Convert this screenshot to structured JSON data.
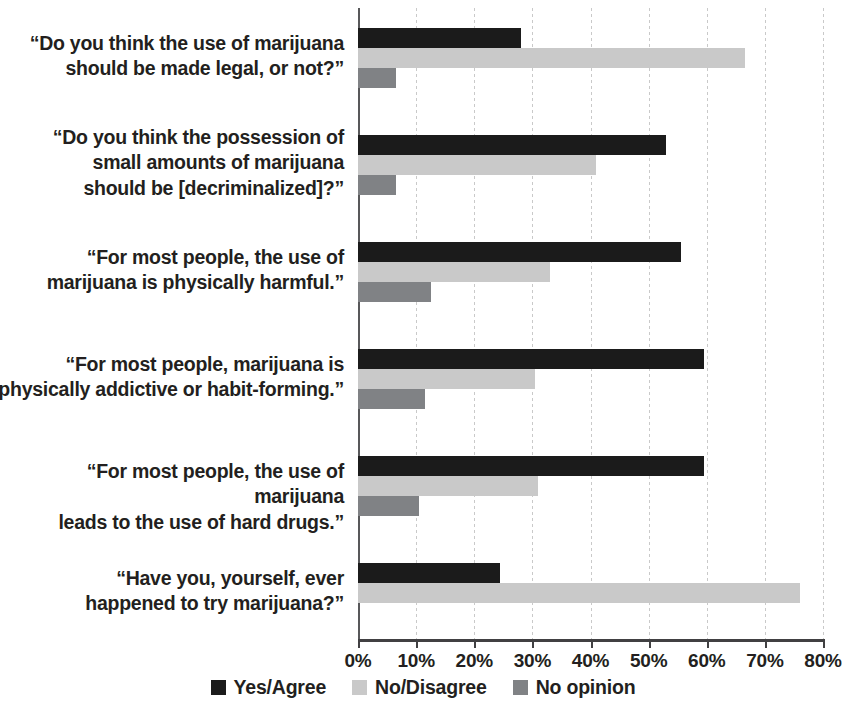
{
  "chart_data": {
    "type": "bar",
    "orientation": "horizontal",
    "title": "",
    "subtitle": "",
    "xlabel": "",
    "ylabel": "",
    "xlim": [
      0,
      80
    ],
    "xtick_labels": [
      "0%",
      "10%",
      "20%",
      "30%",
      "40%",
      "50%",
      "60%",
      "70%",
      "80%"
    ],
    "xtick_values": [
      0,
      10,
      20,
      30,
      40,
      50,
      60,
      70,
      80
    ],
    "grid": "vertical-dashed",
    "legend_position": "bottom-center",
    "categories": [
      "“Do you think the use of marijuana should be made legal, or not?”",
      "“Do you think the possession of small amounts of marijuana should be [decriminalized]?”",
      "“For most people, the use of marijuana is physically harmful.”",
      "“For most people, marijuana is physically addictive or habit-forming.”",
      "“For most people, the use of marijuana leads to the use of hard drugs.”",
      "“Have you, yourself, ever happened to try marijuana?”"
    ],
    "category_lines": [
      [
        "“Do you think the use of marijuana",
        "should be made legal, or not?”"
      ],
      [
        "“Do you think the possession of",
        "small amounts of marijuana",
        "should be [decriminalized]?”"
      ],
      [
        "“For most people, the use of",
        "marijuana is physically harmful.”"
      ],
      [
        "“For most people, marijuana is",
        "physically addictive or habit-forming.”"
      ],
      [
        "“For most people, the use of marijuana",
        "leads to the use of hard drugs.”"
      ],
      [
        "“Have you, yourself, ever",
        "happened to try marijuana?”"
      ]
    ],
    "series": [
      {
        "name": "Yes/Agree",
        "color": "#1b1b1b",
        "values": [
          28,
          53,
          55.5,
          59.5,
          59.5,
          24.5
        ]
      },
      {
        "name": "No/Disagree",
        "color": "#c9c9c9",
        "values": [
          66.5,
          41,
          33,
          30.5,
          31,
          76
        ]
      },
      {
        "name": "No opinion",
        "color": "#808285",
        "values": [
          6.5,
          6.5,
          12.5,
          11.5,
          10.5,
          null
        ]
      }
    ]
  },
  "legend": {
    "items": [
      {
        "label": "Yes/Agree"
      },
      {
        "label": "No/Disagree"
      },
      {
        "label": "No opinion"
      }
    ]
  },
  "axis": {
    "ticks": [
      "0%",
      "10%",
      "20%",
      "30%",
      "40%",
      "50%",
      "60%",
      "70%",
      "80%"
    ]
  }
}
